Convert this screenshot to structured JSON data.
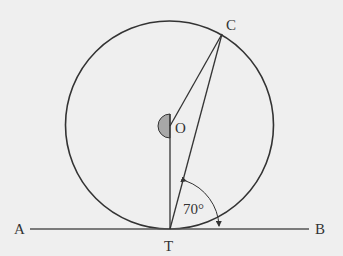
{
  "diagram": {
    "labels": {
      "A": "A",
      "B": "B",
      "T": "T",
      "O": "O",
      "C": "C",
      "angle": "70°"
    },
    "colors": {
      "stroke": "#333333",
      "sector_fill": "#a8a8a8",
      "background": "#efefef"
    }
  }
}
